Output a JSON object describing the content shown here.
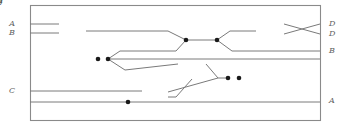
{
  "diagram": {
    "kind": "string-diagram",
    "frame": {
      "x": 30,
      "y": 5,
      "width": 290,
      "height": 115
    },
    "colors": {
      "wire": "#7a7a7a",
      "frame": "#8a8a8a",
      "box_fill": "#ffffff",
      "box_stroke": "#8a8a8a",
      "label": "#5f5f5f",
      "junction": "#1a1a1a",
      "background": "#ffffff"
    },
    "boxes": [
      {
        "id": "box-f",
        "label": "f",
        "x": 59,
        "y": 17,
        "width": 27,
        "height": 28
      },
      {
        "id": "box-h-mid",
        "label": "h",
        "x": 178,
        "y": 49,
        "width": 28,
        "height": 30
      },
      {
        "id": "box-g",
        "label": "g",
        "x": 142,
        "y": 84,
        "width": 26,
        "height": 21
      },
      {
        "id": "box-h-right",
        "label": "h",
        "x": 256,
        "y": 14,
        "width": 28,
        "height": 29
      }
    ],
    "input_ports": [
      {
        "id": "in-A",
        "label": "A",
        "x": 15,
        "y": 24
      },
      {
        "id": "in-B",
        "label": "B",
        "x": 15,
        "y": 33
      },
      {
        "id": "in-C",
        "label": "C",
        "x": 15,
        "y": 91
      }
    ],
    "output_ports": [
      {
        "id": "out-D-1",
        "label": "D",
        "x": 329,
        "y": 24
      },
      {
        "id": "out-D-2",
        "label": "D",
        "x": 329,
        "y": 34
      },
      {
        "id": "out-B",
        "label": "B",
        "x": 329,
        "y": 51
      },
      {
        "id": "out-A",
        "label": "A",
        "x": 329,
        "y": 101
      }
    ],
    "junctions": [
      {
        "id": "junction-fork-left-1",
        "x": 98,
        "y": 59
      },
      {
        "id": "junction-fork-left-2",
        "x": 108,
        "y": 59
      },
      {
        "id": "junction-merge-center-1",
        "x": 186,
        "y": 40
      },
      {
        "id": "junction-merge-center-2",
        "x": 217,
        "y": 40
      },
      {
        "id": "junction-merge-low-1",
        "x": 228,
        "y": 78
      },
      {
        "id": "junction-merge-low-2",
        "x": 239,
        "y": 78
      },
      {
        "id": "junction-bottom-a",
        "x": 128,
        "y": 102
      }
    ],
    "wires": [
      {
        "id": "wire-A-to-f",
        "d": "M 30 24 L 59 24"
      },
      {
        "id": "wire-B-to-f",
        "d": "M 30 33 L 59 33"
      },
      {
        "id": "wire-f-out-to-merge",
        "d": "M 86 31 L 168 31 L 186 40"
      },
      {
        "id": "wire-fork-to-upper",
        "d": "M 108 59 L 120 51 L 176 51 L 186 40"
      },
      {
        "id": "wire-merge-to-merge",
        "d": "M 186 40 L 217 40"
      },
      {
        "id": "wire-merge-to-h-right",
        "d": "M 217 40 L 230 31 L 256 31"
      },
      {
        "id": "wire-merge-to-outB",
        "d": "M 217 40 L 232 51 L 320 51"
      },
      {
        "id": "wire-h-right-cross-top",
        "d": "M 284 24 L 320 34"
      },
      {
        "id": "wire-h-right-cross-bottom",
        "d": "M 284 34 L 320 24"
      },
      {
        "id": "wire-fork-to-lower",
        "d": "M 108 59 L 125 70 L 178 64"
      },
      {
        "id": "wire-horizontal-mid",
        "d": "M 108 59 L 320 59"
      },
      {
        "id": "wire-h-mid-out-down",
        "d": "M 206 64 L 218 78 L 228 78"
      },
      {
        "id": "wire-h-mid-down-to-g",
        "d": "M 192 79 L 176 97 L 168 97"
      },
      {
        "id": "wire-g-out-to-merge",
        "d": "M 168 92 L 218 78"
      },
      {
        "id": "wire-C-to-g",
        "d": "M 30 91 L 142 91"
      },
      {
        "id": "wire-bottom-A",
        "d": "M 30 102 L 320 102"
      }
    ]
  }
}
